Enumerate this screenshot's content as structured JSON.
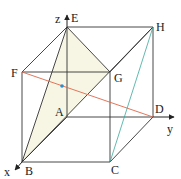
{
  "figure": {
    "type": "cube-diagram",
    "vertices": {
      "A": {
        "label": "A",
        "x": 67,
        "y": 117
      },
      "B": {
        "label": "B",
        "x": 22,
        "y": 162
      },
      "C": {
        "label": "C",
        "x": 110,
        "y": 162
      },
      "D": {
        "label": "D",
        "x": 153,
        "y": 117
      },
      "E": {
        "label": "E",
        "x": 67,
        "y": 27
      },
      "F": {
        "label": "F",
        "x": 22,
        "y": 72
      },
      "G": {
        "label": "G",
        "x": 110,
        "y": 72
      },
      "H": {
        "label": "H",
        "x": 153,
        "y": 27
      }
    },
    "axes": {
      "x": {
        "label": "x"
      },
      "y": {
        "label": "y"
      },
      "z": {
        "label": "z"
      }
    },
    "highlighted_segments": [
      {
        "name": "FD",
        "color": "#e0664a"
      },
      {
        "name": "CH",
        "color": "#3aa89a"
      }
    ],
    "shaded_triangle": {
      "vertices": [
        "E",
        "B",
        "G"
      ],
      "fill": "#f7f6e4"
    },
    "point_marker": {
      "color": "#2a8fd0"
    }
  }
}
